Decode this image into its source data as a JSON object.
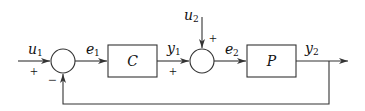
{
  "diagram": {
    "type": "feedback-block-diagram",
    "colors": {
      "line": "#333333",
      "text": "#111111",
      "background": "#ffffff"
    },
    "blocks": [
      {
        "id": "C",
        "label": "C"
      },
      {
        "id": "P",
        "label": "P"
      }
    ],
    "summing_junctions": [
      {
        "id": "sum1",
        "inputs": [
          {
            "from": "u1",
            "sign": "+"
          },
          {
            "from": "feedback",
            "sign": "−"
          }
        ],
        "output": "e1"
      },
      {
        "id": "sum2",
        "inputs": [
          {
            "from": "y1",
            "sign": "+"
          },
          {
            "from": "u2",
            "sign": "+"
          }
        ],
        "output": "e2"
      }
    ],
    "signals": {
      "u1": {
        "base": "u",
        "sub": "1"
      },
      "e1": {
        "base": "e",
        "sub": "1"
      },
      "y1": {
        "base": "y",
        "sub": "1"
      },
      "u2": {
        "base": "u",
        "sub": "2"
      },
      "e2": {
        "base": "e",
        "sub": "2"
      },
      "y2": {
        "base": "y",
        "sub": "2"
      }
    },
    "signs": {
      "u1_sign": "+",
      "feedback_sign": "−",
      "y1_sign": "+",
      "u2_sign": "+"
    },
    "edges": [
      {
        "from": "u1",
        "to": "sum1"
      },
      {
        "from": "sum1",
        "to": "C",
        "signal": "e1"
      },
      {
        "from": "C",
        "to": "sum2",
        "signal": "y1"
      },
      {
        "from": "u2",
        "to": "sum2"
      },
      {
        "from": "sum2",
        "to": "P",
        "signal": "e2"
      },
      {
        "from": "P",
        "to": "output",
        "signal": "y2"
      },
      {
        "from": "y2",
        "to": "sum1",
        "type": "feedback"
      }
    ]
  }
}
